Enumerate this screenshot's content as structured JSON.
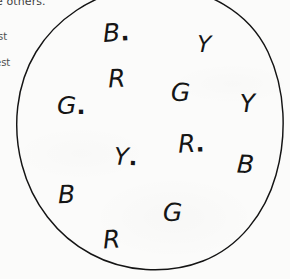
{
  "page": {
    "background_color": "#fbfbfa",
    "ink_color": "#151515"
  },
  "margin_text": {
    "top_fragment": "e others.",
    "left_fragment_1": "st",
    "left_fragment_2": "est"
  },
  "circle": {
    "name": "hand-drawn-circle",
    "stroke_color": "#141414",
    "cropped_top": true,
    "cropped_right": false
  },
  "letters": [
    {
      "id": "letter-b-1",
      "text": "B",
      "period": ".",
      "x": 103,
      "y": 20,
      "size": 25,
      "rotate": -4
    },
    {
      "id": "letter-y-1",
      "text": "Y",
      "period": "",
      "x": 197,
      "y": 33,
      "size": 23,
      "rotate": 2
    },
    {
      "id": "letter-r-1",
      "text": "R",
      "period": "",
      "x": 108,
      "y": 66,
      "size": 25,
      "rotate": -3
    },
    {
      "id": "letter-g-1",
      "text": "G",
      "period": ".",
      "x": 57,
      "y": 93,
      "size": 25,
      "rotate": 0
    },
    {
      "id": "letter-g-2",
      "text": "G",
      "period": "",
      "x": 171,
      "y": 80,
      "size": 25,
      "rotate": 1
    },
    {
      "id": "letter-y-2",
      "text": "Y",
      "period": "",
      "x": 240,
      "y": 91,
      "size": 25,
      "rotate": -2
    },
    {
      "id": "letter-r-2",
      "text": "R",
      "period": ".",
      "x": 178,
      "y": 131,
      "size": 25,
      "rotate": -3
    },
    {
      "id": "letter-y-3",
      "text": "Y",
      "period": ".",
      "x": 114,
      "y": 145,
      "size": 24,
      "rotate": 2
    },
    {
      "id": "letter-b-2",
      "text": "B",
      "period": "",
      "x": 237,
      "y": 152,
      "size": 25,
      "rotate": 3
    },
    {
      "id": "letter-b-3",
      "text": "B",
      "period": "",
      "x": 58,
      "y": 182,
      "size": 25,
      "rotate": -2
    },
    {
      "id": "letter-g-3",
      "text": "G",
      "period": "",
      "x": 163,
      "y": 200,
      "size": 25,
      "rotate": 1
    },
    {
      "id": "letter-r-3",
      "text": "R",
      "period": "",
      "x": 103,
      "y": 227,
      "size": 25,
      "rotate": -4
    }
  ]
}
